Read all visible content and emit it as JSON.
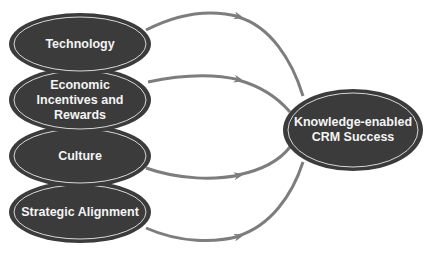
{
  "diagram": {
    "type": "flow",
    "sources": [
      {
        "id": "technology",
        "label": "Technology"
      },
      {
        "id": "economic",
        "label": "Economic\nIncentives and\nRewards"
      },
      {
        "id": "culture",
        "label": "Culture"
      },
      {
        "id": "strategic",
        "label": "Strategic Alignment"
      }
    ],
    "target": {
      "id": "crm",
      "label": "Knowledge-enabled\nCRM Success"
    },
    "edges": [
      {
        "from": "technology",
        "to": "crm"
      },
      {
        "from": "economic",
        "to": "crm"
      },
      {
        "from": "culture",
        "to": "crm"
      },
      {
        "from": "strategic",
        "to": "crm"
      }
    ],
    "colors": {
      "node_fill": "#3b3b3b",
      "node_inner_ring": "#d8d8d8",
      "node_text": "#f4f4f4",
      "arrow": "#7d7d7d"
    }
  }
}
